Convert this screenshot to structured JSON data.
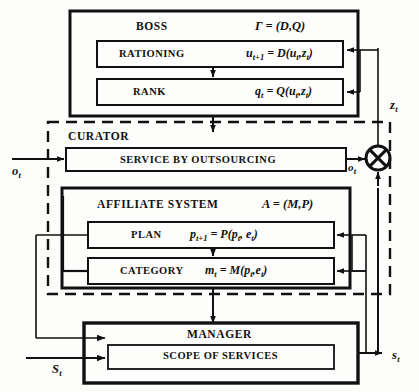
{
  "diagram": {
    "title_semantic": "hierarchical-control-block-diagram",
    "blocks": {
      "boss": {
        "label": "BOSS",
        "param": "Γ = (D,Q)",
        "children": [
          {
            "name": "rationing",
            "label": "RATIONING",
            "formula_main": "u",
            "formula": "u t+1 = D(u t ,z t )"
          },
          {
            "name": "rank",
            "label": "RANK",
            "formula": "q t = Q(u t ,z t )"
          }
        ]
      },
      "curator": {
        "label": "CURATOR",
        "children": [
          {
            "name": "service-by-outsourcing",
            "label": "SERVICE BY OUTSOURCING"
          }
        ]
      },
      "affiliate_system": {
        "label": "AFFILIATE SYSTEM",
        "param": "A = (M,P)",
        "children": [
          {
            "name": "plan",
            "label": "PLAN",
            "formula": "p t+1 = P(p t , e t )"
          },
          {
            "name": "category",
            "label": "CATEGORY",
            "formula": "m t = M(p t ,e t )"
          }
        ]
      },
      "manager": {
        "label": "MANAGER",
        "children": [
          {
            "name": "scope-of-services",
            "label": "SCOPE OF SERVICES"
          }
        ]
      }
    },
    "signals": {
      "o_t_in": "o",
      "o_t_out": "o",
      "z_t": "z",
      "s_t_in": "S",
      "s_t_out": "s",
      "subscript_t": "t"
    },
    "operator_node": {
      "name": "crossed-circle-operator",
      "symbol": "⊗"
    },
    "colors": {
      "stroke": "#111111",
      "background": "#fdfdfb",
      "text": "#111111"
    }
  }
}
